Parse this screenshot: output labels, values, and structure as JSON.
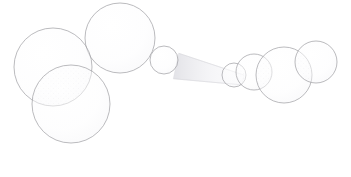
{
  "document": {
    "title": "Sphere Cluster Diagram",
    "width": 351,
    "height": 177,
    "background_color": "#ffffff"
  },
  "style": {
    "stroke_color": "#9a9a9e",
    "stroke_color_faint": "#d8d8dc",
    "stroke_width": 0.8,
    "fill_color": "#fdfdfd",
    "fill_opacity": 0.55,
    "stipple_color": "#e4e4e8",
    "connector_color": "#ececf0"
  },
  "scene": {
    "label": "two-sphere-clusters-joined-by-tapered-tube",
    "cluster_count": 2,
    "sphere_count": 7
  },
  "connector": {
    "name": "tapered-tube",
    "from_x": 176,
    "from_y": 66,
    "to_x": 243,
    "to_y": 80,
    "from_radius": 13,
    "to_radius": 5,
    "color": "#ececf0"
  },
  "clusters": [
    {
      "name": "left-cluster",
      "spheres": [
        {
          "name": "sphere-top",
          "cx": 120,
          "cy": 38,
          "r": 35
        },
        {
          "name": "sphere-left",
          "cx": 53,
          "cy": 67,
          "r": 39
        },
        {
          "name": "sphere-bottom",
          "cx": 71,
          "cy": 104,
          "r": 39
        },
        {
          "name": "sphere-cap",
          "cx": 164,
          "cy": 60,
          "r": 14
        }
      ]
    },
    {
      "name": "right-cluster",
      "spheres": [
        {
          "name": "sphere-small",
          "cx": 234,
          "cy": 75,
          "r": 12
        },
        {
          "name": "sphere-medium",
          "cx": 254,
          "cy": 72,
          "r": 18
        },
        {
          "name": "sphere-large",
          "cx": 284,
          "cy": 75,
          "r": 28
        },
        {
          "name": "sphere-far",
          "cx": 316,
          "cy": 62,
          "r": 21
        }
      ]
    }
  ]
}
